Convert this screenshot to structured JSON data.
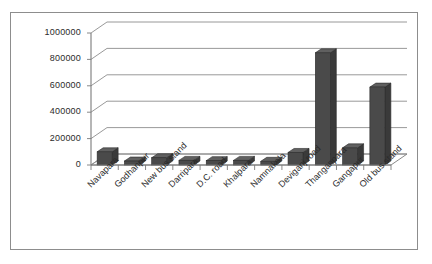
{
  "chart_data": {
    "type": "bar",
    "title": "",
    "subtitle": "",
    "xlabel": "",
    "ylabel": "",
    "ylim": [
      0,
      1000000
    ],
    "ytick_step": 200000,
    "grid": true,
    "legend": false,
    "style": "3d-column",
    "bar_color": "#4a4a4a",
    "bar_side_color": "#3a3a3a",
    "bar_top_color": "#606060",
    "gridline_color": "#8d8d8d",
    "axis_color": "#7a7a7a",
    "frame_color": "#8d8d8d",
    "background": "#ffffff",
    "yticks": [
      "0",
      "200000",
      "400000",
      "600000",
      "800000",
      "1000000"
    ],
    "ytick_values": [
      0,
      200000,
      400000,
      600000,
      800000,
      1000000
    ],
    "categories": [
      "Navapara",
      "Godhanpur",
      "New bus stand",
      "Darripara",
      "D.C. road",
      "Khalpara",
      "Namnakala",
      "Deviganj road",
      "Thanganpara",
      "Gangapur",
      "Old bus stand"
    ],
    "values": [
      100000,
      30000,
      55000,
      35000,
      33000,
      35000,
      28000,
      95000,
      850000,
      130000,
      590000
    ]
  }
}
